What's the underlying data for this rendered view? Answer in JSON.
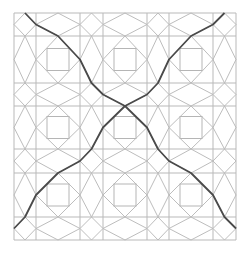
{
  "figure": {
    "colors": {
      "background": "#ffffff",
      "grid_line": "#b9b9b9",
      "diamond_line": "#bdbdbd",
      "square_line": "#b5b5b5",
      "curve_line": "#4a4a4a"
    },
    "grid_x": [
      14,
      36,
      80,
      103,
      147,
      169,
      213,
      236
    ],
    "grid_y": [
      13,
      36,
      83,
      106,
      149,
      173,
      217,
      240
    ],
    "square_half_size": 11,
    "curves": [
      {
        "name": "curve-top-left-to-bottom-right",
        "points": [
          [
            25,
            13
          ],
          [
            36,
            24.5
          ],
          [
            58,
            36
          ],
          [
            80,
            59.5
          ],
          [
            91.5,
            83
          ],
          [
            103,
            94.5
          ],
          [
            125,
            106
          ],
          [
            147,
            127.5
          ],
          [
            158,
            149
          ],
          [
            169,
            161
          ],
          [
            191,
            173
          ],
          [
            213,
            195
          ],
          [
            224.5,
            217
          ],
          [
            236,
            228.5
          ]
        ]
      },
      {
        "name": "curve-top-right-to-bottom-left",
        "points": [
          [
            224.5,
            13
          ],
          [
            213,
            24.5
          ],
          [
            191,
            36
          ],
          [
            169,
            59.5
          ],
          [
            158,
            83
          ],
          [
            147,
            94.5
          ],
          [
            125,
            106
          ],
          [
            103,
            127.5
          ],
          [
            91.5,
            149
          ],
          [
            80,
            161
          ],
          [
            58,
            173
          ],
          [
            36,
            195
          ],
          [
            25,
            217
          ],
          [
            14,
            228.5
          ]
        ]
      }
    ]
  }
}
